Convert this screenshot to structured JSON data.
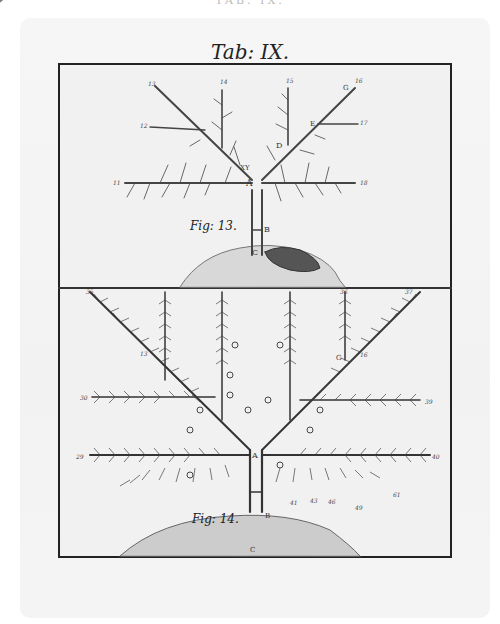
{
  "running_head": "TAB. IX.",
  "plate": {
    "title": "Tab: IX.",
    "colors": {
      "paper": "#f2f2f2",
      "ink": "#222222",
      "frame": "#222222"
    }
  },
  "figure_13": {
    "caption": "Fig: 13.",
    "point_labels": [
      "A",
      "B",
      "C",
      "D",
      "E",
      "G",
      "X",
      "Y"
    ],
    "branch_numbers": [
      "11",
      "12",
      "13",
      "14",
      "15",
      "16",
      "17",
      "18"
    ],
    "detail_numbers": [
      "16",
      "44",
      "45",
      "2",
      "36",
      "57",
      "53",
      "58",
      "55",
      "8",
      "52",
      "3",
      "66",
      "63",
      "62",
      "64",
      "50",
      "42",
      "47",
      "48",
      "41",
      "43",
      "46",
      "49",
      "59",
      "60",
      "61",
      "4"
    ]
  },
  "figure_14": {
    "caption": "Fig: 14.",
    "point_labels": [
      "A",
      "B",
      "C",
      "G"
    ],
    "branch_numbers": [
      "13",
      "16",
      "29",
      "30",
      "35",
      "36",
      "37",
      "39",
      "40"
    ],
    "detail_numbers": [
      "14",
      "55",
      "58",
      "66",
      "52",
      "62",
      "61",
      "64",
      "60",
      "41",
      "43",
      "46",
      "49"
    ]
  }
}
